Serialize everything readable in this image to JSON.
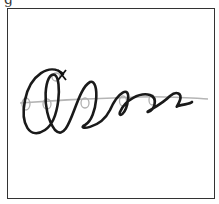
{
  "figure": {
    "panel_label": "g",
    "colors": {
      "coil": "#1a1a1a",
      "axis": "#b0b0b0",
      "frame": "#333333"
    }
  }
}
